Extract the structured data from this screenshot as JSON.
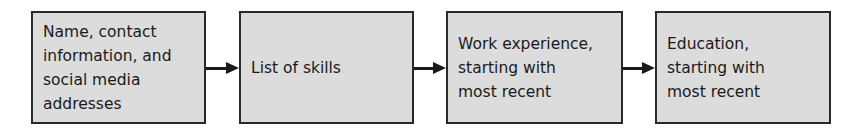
{
  "diagram": {
    "type": "flowchart",
    "direction": "left-to-right",
    "colors": {
      "box_fill": "#dcdcdc",
      "box_border": "#2a2a2a",
      "text": "#1a1a1a",
      "arrow": "#1a1a1a"
    },
    "nodes": [
      {
        "id": "contact",
        "label": "Name, contact\ninformation, and\nsocial media\naddresses"
      },
      {
        "id": "skills",
        "label": "List of skills"
      },
      {
        "id": "work",
        "label": "Work experience,\nstarting with\nmost recent"
      },
      {
        "id": "education",
        "label": "Education,\nstarting with\nmost recent"
      }
    ],
    "edges": [
      {
        "from": "contact",
        "to": "skills"
      },
      {
        "from": "skills",
        "to": "work"
      },
      {
        "from": "work",
        "to": "education"
      }
    ]
  }
}
